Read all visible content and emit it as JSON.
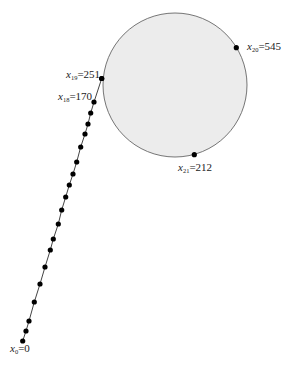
{
  "diagram": {
    "title": "",
    "width": 291,
    "height": 368,
    "colors": {
      "background": "#ffffff",
      "cycle_fill": "#ececec",
      "cycle_stroke": "#666666",
      "line": "#444444",
      "dot": "#000000",
      "text": "#222222"
    },
    "cycle": {
      "cx": 175,
      "cy": 85,
      "r": 72
    },
    "tail_points": [
      [
        22.7,
        341
      ],
      [
        26,
        331
      ],
      [
        29,
        321
      ],
      [
        34.3,
        302
      ],
      [
        40,
        284
      ],
      [
        45,
        267
      ],
      [
        50.3,
        250
      ],
      [
        53.3,
        239
      ],
      [
        58.3,
        224
      ],
      [
        61.7,
        210
      ],
      [
        65.7,
        197
      ],
      [
        69.3,
        185
      ],
      [
        73,
        174
      ],
      [
        76.7,
        162
      ],
      [
        80.7,
        147
      ],
      [
        85,
        134
      ],
      [
        88,
        124
      ],
      [
        90.7,
        113
      ],
      [
        94,
        102
      ],
      [
        101.7,
        78.5
      ]
    ],
    "cycle_points": [
      [
        101.7,
        78.5
      ],
      [
        236.3,
        47.7
      ],
      [
        194.3,
        154.7
      ]
    ],
    "labels": [
      {
        "id": "x0",
        "var": "x",
        "sub": "0",
        "value": "=0",
        "x": 10,
        "y": 343
      },
      {
        "id": "x18",
        "var": "x",
        "sub": "18",
        "value": "=170",
        "x": 58,
        "y": 91
      },
      {
        "id": "x19",
        "var": "x",
        "sub": "19",
        "value": "=251",
        "x": 66,
        "y": 69
      },
      {
        "id": "x20",
        "var": "x",
        "sub": "20",
        "value": "=545",
        "x": 247,
        "y": 41
      },
      {
        "id": "x21",
        "var": "x",
        "sub": "21",
        "value": "=212",
        "x": 178,
        "y": 162
      }
    ]
  }
}
